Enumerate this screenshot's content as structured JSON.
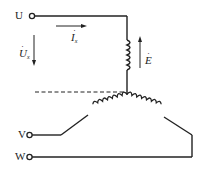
{
  "diagram": {
    "type": "three-phase winding, star connection, phase U equivalent",
    "terminals": {
      "u": "U",
      "v": "V",
      "w": "W"
    },
    "quantities": {
      "voltage": {
        "symbol": "U",
        "subscript": "x",
        "dot": "·",
        "direction": "down"
      },
      "current": {
        "symbol": "I",
        "subscript": "x",
        "dot": "·",
        "direction": "right"
      },
      "emf": {
        "symbol": "E",
        "dot": "·",
        "direction": "up"
      }
    },
    "colors": {
      "line": "#222222",
      "background": "#ffffff"
    }
  }
}
